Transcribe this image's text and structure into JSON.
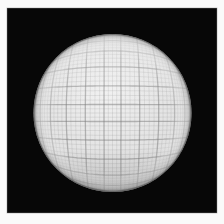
{
  "scene": {
    "description": "Photograph of a light gray sphere covered in a fine graph-paper grid, centered on a black backdrop inside a white photo frame",
    "frame": {
      "color": "#fafafa",
      "inset_left": 7,
      "inset_top": 8,
      "inset_right": 7,
      "inset_bottom": 11
    },
    "backdrop": {
      "color": "#070707",
      "edge_color": "#8a8a8a"
    },
    "sphere": {
      "cx": 112.5,
      "cy": 113,
      "r": 79,
      "highlight_color": "#f1f1f1",
      "base_color": "#e6e6e6",
      "mid_color": "#dfdfdf",
      "shadow_color": "#d5d5d5",
      "rim_color": "#c8c8c8",
      "edge_dark_color": "#3c3c3c",
      "grid": {
        "minor_step_deg": 3,
        "major_every": 4,
        "minor_color": "#8f8f8f",
        "major_color": "#7a7a7a",
        "minor_opacity": 0.25,
        "major_opacity": 0.5,
        "minor_width": 0.75,
        "major_width": 1.3,
        "curvature_exponent": 2.5
      }
    }
  }
}
